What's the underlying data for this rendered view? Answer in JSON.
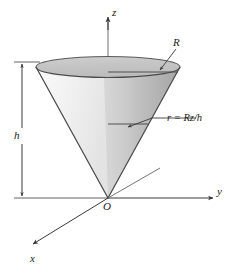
{
  "figure": {
    "background_color": "#ffffff",
    "stroke_color": "#3a3a3a",
    "surface_light_color": "#f4f4f4",
    "surface_mid_color": "#d2d2d2",
    "surface_dark_color": "#a8a8a8",
    "interior_color": "#c9c9c9"
  },
  "axes": {
    "z": {
      "label": "z",
      "direction": "up",
      "arrow": true
    },
    "y": {
      "label": "y",
      "direction": "right",
      "arrow": true
    },
    "x": {
      "label": "x",
      "direction": "down-left",
      "arrow": true
    },
    "origin": {
      "label": "O"
    }
  },
  "dimensions": {
    "height": {
      "label": "h",
      "kind": "double-arrow",
      "orientation": "vertical"
    },
    "radius_top": {
      "label": "R",
      "kind": "leader-arrow"
    }
  },
  "annotations": {
    "radius_formula": {
      "label": "r = Rz/h",
      "kind": "leader-arrow"
    }
  }
}
